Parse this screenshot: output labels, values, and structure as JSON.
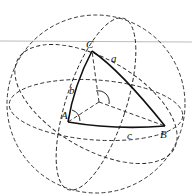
{
  "diagram": {
    "vertices": {
      "A": "A",
      "B": "B",
      "C": "C"
    },
    "sides": {
      "a": "a",
      "b": "b",
      "c": "c"
    }
  }
}
